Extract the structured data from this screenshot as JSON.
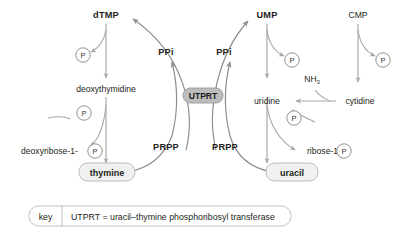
{
  "diagram": {
    "nodes": {
      "dtmp": "dTMP",
      "deoxythymidine": "deoxythymidine",
      "deoxyribose_1_p": "deoxyribose-1-",
      "thymine": "thymine",
      "ump": "UMP",
      "uridine": "uridine",
      "ribose_1_p": "ribose-1-",
      "uracil": "uracil",
      "cmp": "CMP",
      "cytidine": "cytidine",
      "enzyme": "UTPRT"
    },
    "cofactors": {
      "ppi_left": "PPi",
      "ppi_right": "PPi",
      "prpp_left": "PRPP",
      "prpp_right": "PRPP",
      "ammonia": "NH",
      "ammonia_sub": "3",
      "phosphate_symbol": "P"
    },
    "phosphates": [
      {
        "id": "p-dtmp",
        "label": "P"
      },
      {
        "id": "p-deoxythymidine",
        "label": "P"
      },
      {
        "id": "p-deoxyribose",
        "label": "P"
      },
      {
        "id": "p-ump",
        "label": "P"
      },
      {
        "id": "p-uridine",
        "label": "P"
      },
      {
        "id": "p-ribose",
        "label": "P"
      },
      {
        "id": "p-cmp",
        "label": "P"
      }
    ],
    "key": {
      "label": "key",
      "text": "UTPRT = uracil–thymine phosphoribosyl transferase"
    },
    "colors": {
      "background": "#ffffff",
      "text": "#231f20",
      "arrow": "#a7a7a7",
      "node_fill": "#f0f0f0",
      "node_stroke": "#bdbdbd",
      "enzyme_fill": "#bcbcbc"
    }
  }
}
